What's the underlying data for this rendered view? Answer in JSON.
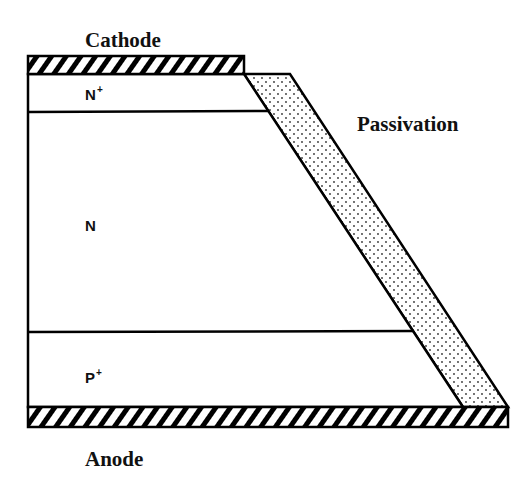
{
  "figure": {
    "type": "semiconductor-cross-section",
    "colors": {
      "stroke": "#000000",
      "background": "#ffffff",
      "passivation_dots": "#333333"
    }
  },
  "labels": {
    "cathode": "Cathode",
    "anode": "Anode",
    "passivation": "Passivation"
  },
  "regions": [
    {
      "name": "N",
      "superscript": "+"
    },
    {
      "name": "N",
      "superscript": ""
    },
    {
      "name": "P",
      "superscript": "+"
    }
  ],
  "layers": [
    {
      "id": "cathode-contact",
      "pattern": "hatched"
    },
    {
      "id": "n-plus",
      "pattern": "none"
    },
    {
      "id": "n-drift",
      "pattern": "none"
    },
    {
      "id": "p-plus",
      "pattern": "none"
    },
    {
      "id": "anode-contact",
      "pattern": "hatched"
    },
    {
      "id": "passivation",
      "pattern": "dotted"
    }
  ]
}
